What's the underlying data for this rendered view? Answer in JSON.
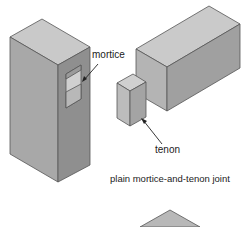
{
  "diagram": {
    "caption": "plain mortice-and-tenon joint",
    "labels": {
      "mortice": "mortice",
      "tenon": "tenon"
    },
    "colors": {
      "top_face": "#c8c8c8",
      "front_face": "#a9a9a9",
      "side_face": "#8e8e8e",
      "outline": "#444444"
    }
  }
}
